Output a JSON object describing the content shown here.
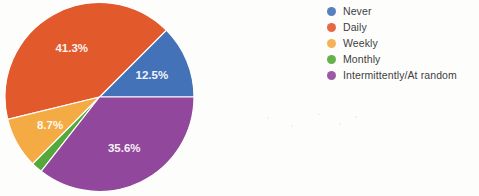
{
  "chart_data": {
    "type": "pie",
    "title": "",
    "categories": [
      "Never",
      "Daily",
      "Weekly",
      "Monthly",
      "Intermittently/At random"
    ],
    "values": [
      12.5,
      41.3,
      8.7,
      1.9,
      35.6
    ],
    "value_labels": [
      "12.5%",
      "41.3%",
      "8.7%",
      "",
      "35.6%"
    ],
    "colors": [
      "#4472b8",
      "#e2592c",
      "#f5ab43",
      "#56a83a",
      "#91479b"
    ],
    "legend_position": "right",
    "start_angle_deg": 0,
    "direction": "counterclockwise",
    "units": "percent"
  },
  "legend": {
    "items": [
      {
        "label": "Never",
        "color": "#4472b8"
      },
      {
        "label": "Daily",
        "color": "#e2592c"
      },
      {
        "label": "Weekly",
        "color": "#f5ab43"
      },
      {
        "label": "Monthly",
        "color": "#56a83a"
      },
      {
        "label": "Intermittently/At random",
        "color": "#91479b"
      }
    ]
  }
}
